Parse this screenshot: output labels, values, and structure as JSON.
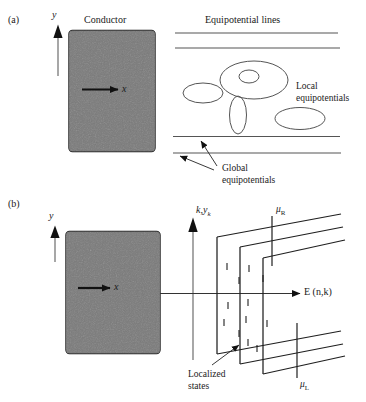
{
  "figure": {
    "panels": [
      {
        "tag": "(a)",
        "conductor_label": "Conductor",
        "axis_y": "y",
        "axis_x": "x",
        "diagram_title": "Equipotential lines",
        "annotations": [
          "Local equipotentials",
          "Global equipotentials"
        ],
        "local_label_line1": "Local",
        "local_label_line2": "equipotentials",
        "global_label_line1": "Global",
        "global_label_line2": "equipotentials",
        "global_line_count": 4,
        "local_ellipse_count": 6
      },
      {
        "tag": "(b)",
        "axis_y": "k",
        "axis_y_sub": "y",
        "axis_y_sub2": "k",
        "axis_y_full": "k,y",
        "axis_x_label": "E (n,k)",
        "axis_x_italic": "E",
        "axis_x_rest": " (n,k)",
        "axis_y_panel": "y",
        "axis_x_panel": "x",
        "mu_right": "μ",
        "mu_right_sub": "R",
        "mu_left": "μ",
        "mu_left_sub": "L",
        "localized_line1": "Localized",
        "localized_line2": "states",
        "band_count": 3,
        "tick_count": 12
      }
    ],
    "colors": {
      "conductor_fill": "#767676",
      "conductor_stroke": "#1a1a1a",
      "line": "#3a3a3a",
      "text": "#1a1a1a",
      "background": "#ffffff",
      "axis_gray": "#8a8a8a"
    }
  }
}
